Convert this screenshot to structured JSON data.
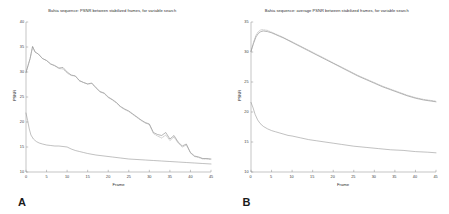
{
  "figure": {
    "panels": [
      {
        "panel_letter": "A",
        "title": "Bahia sequence: PSNR between stabilized frames, for variable search",
        "xlabel": "Frame",
        "ylabel": "PSNR"
      },
      {
        "panel_letter": "B",
        "title": "Bahia sequence: average PSNR between stabilized frames, for variable search",
        "xlabel": "Frame",
        "ylabel": "PSNR"
      }
    ]
  },
  "chart_data": [
    {
      "type": "line",
      "title": "Bahia sequence: PSNR between stabilized frames, for variable search",
      "xlabel": "Frame",
      "ylabel": "PSNR",
      "xlim": [
        0,
        45
      ],
      "ylim": [
        10,
        40
      ],
      "xticks": [
        0,
        5,
        10,
        15,
        20,
        25,
        30,
        35,
        40,
        45
      ],
      "yticks": [
        10,
        15,
        20,
        25,
        30,
        35,
        40
      ],
      "grid": false,
      "legend": "none",
      "series": [
        {
          "name": "stabilized-psnr-solid",
          "style": "solid",
          "x": [
            0,
            1,
            1.6,
            2.2,
            3,
            4,
            5,
            6,
            7,
            8,
            9,
            10,
            11,
            12,
            13,
            14,
            15,
            16,
            17,
            18,
            19,
            20,
            21,
            22,
            23,
            24,
            25,
            26,
            27,
            28,
            29,
            30,
            31,
            32,
            33,
            34,
            35,
            36,
            37,
            38,
            39,
            40,
            41,
            42,
            43,
            44,
            45
          ],
          "y": [
            29.9,
            32.7,
            35.1,
            34.0,
            33.6,
            32.7,
            32.3,
            31.6,
            31.3,
            30.8,
            30.9,
            30.0,
            29.4,
            29.2,
            28.3,
            27.9,
            27.6,
            27.8,
            26.9,
            26.1,
            25.8,
            25.0,
            24.5,
            23.9,
            23.1,
            22.6,
            22.2,
            21.6,
            21.0,
            20.4,
            19.9,
            19.6,
            17.9,
            17.5,
            17.3,
            17.9,
            16.6,
            17.3,
            16.0,
            15.2,
            15.6,
            13.9,
            13.2,
            13.0,
            12.7,
            12.7,
            12.6
          ]
        },
        {
          "name": "stabilized-psnr-dashed",
          "style": "dashed",
          "x": [
            0,
            1,
            1.6,
            2.2,
            3,
            4,
            5,
            6,
            7,
            8,
            9,
            10,
            11,
            12,
            13,
            14,
            15,
            16,
            17,
            18,
            19,
            20,
            21,
            22,
            23,
            24,
            25,
            26,
            27,
            28,
            29,
            30,
            31,
            32,
            33,
            34,
            35,
            36,
            37,
            38,
            39,
            40,
            41,
            42,
            43,
            44,
            45
          ],
          "y": [
            29.9,
            32.7,
            35.1,
            34.0,
            33.6,
            32.7,
            32.3,
            31.6,
            31.2,
            30.7,
            30.6,
            29.8,
            29.3,
            29.2,
            28.2,
            27.9,
            27.6,
            27.7,
            26.8,
            26.0,
            25.7,
            24.9,
            24.4,
            23.8,
            23.0,
            22.5,
            22.1,
            21.5,
            20.9,
            20.3,
            19.8,
            19.5,
            17.7,
            17.2,
            16.8,
            17.4,
            16.3,
            17.0,
            15.8,
            15.0,
            15.4,
            13.8,
            13.1,
            12.9,
            12.6,
            12.6,
            12.5
          ]
        },
        {
          "name": "unstabilized-psnr",
          "style": "solid",
          "x": [
            0,
            0.4,
            0.8,
            1.2,
            1.8,
            2.5,
            3.2,
            4,
            5,
            6,
            7,
            8,
            9,
            10,
            11,
            12,
            13,
            14,
            15,
            17,
            19,
            21,
            23,
            25,
            27,
            29,
            31,
            33,
            35,
            37,
            39,
            41,
            43,
            45
          ],
          "y": [
            21.8,
            20.3,
            18.6,
            17.4,
            16.6,
            16.1,
            15.8,
            15.6,
            15.4,
            15.3,
            15.2,
            15.2,
            15.1,
            15.0,
            14.6,
            14.3,
            14.1,
            13.9,
            13.7,
            13.4,
            13.2,
            13.0,
            12.8,
            12.6,
            12.5,
            12.4,
            12.3,
            12.2,
            12.1,
            12.0,
            11.9,
            11.8,
            11.7,
            11.6
          ]
        }
      ]
    },
    {
      "type": "line",
      "title": "Bahia sequence: average PSNR between stabilized frames, for variable search",
      "xlabel": "Frame",
      "ylabel": "PSNR",
      "xlim": [
        0,
        45
      ],
      "ylim": [
        10,
        35
      ],
      "xticks": [
        0,
        5,
        10,
        15,
        20,
        25,
        30,
        35,
        40,
        45
      ],
      "yticks": [
        10,
        15,
        20,
        25,
        30,
        35
      ],
      "grid": false,
      "legend": "none",
      "series": [
        {
          "name": "average-stabilized-psnr-solid",
          "style": "solid",
          "x": [
            0,
            0.6,
            1.2,
            1.8,
            2.4,
            3,
            4,
            5,
            6,
            7,
            8,
            10,
            12,
            14,
            16,
            18,
            20,
            22,
            24,
            26,
            28,
            30,
            32,
            34,
            36,
            38,
            40,
            42,
            44,
            45
          ],
          "y": [
            30.1,
            31.4,
            32.5,
            33.1,
            33.4,
            33.5,
            33.4,
            33.2,
            32.9,
            32.6,
            32.3,
            31.6,
            30.9,
            30.2,
            29.5,
            28.8,
            28.1,
            27.4,
            26.7,
            26.0,
            25.4,
            24.8,
            24.2,
            23.7,
            23.2,
            22.7,
            22.3,
            22.0,
            21.8,
            21.7
          ]
        },
        {
          "name": "average-stabilized-psnr-dashed",
          "style": "dashed",
          "x": [
            0,
            0.6,
            1.2,
            1.8,
            2.4,
            3,
            4,
            5,
            6,
            7,
            8,
            10,
            12,
            14,
            16,
            18,
            20,
            22,
            24,
            26,
            28,
            30,
            32,
            34,
            36,
            38,
            40,
            42,
            44,
            45
          ],
          "y": [
            30.1,
            31.6,
            32.8,
            33.4,
            33.7,
            33.7,
            33.6,
            33.3,
            33.0,
            32.7,
            32.4,
            31.7,
            31.0,
            30.3,
            29.6,
            28.9,
            28.2,
            27.5,
            26.8,
            26.1,
            25.5,
            24.9,
            24.3,
            23.8,
            23.3,
            22.8,
            22.4,
            22.1,
            21.9,
            21.8
          ]
        },
        {
          "name": "average-unstabilized-psnr",
          "style": "solid",
          "x": [
            0,
            0.5,
            1,
            1.6,
            2.2,
            3,
            4,
            5,
            6,
            7,
            8,
            9,
            10,
            12,
            14,
            16,
            18,
            20,
            22,
            25,
            28,
            31,
            34,
            37,
            40,
            43,
            45
          ],
          "y": [
            21.6,
            20.7,
            19.6,
            18.7,
            18.1,
            17.6,
            17.2,
            16.9,
            16.7,
            16.5,
            16.3,
            16.1,
            16.0,
            15.7,
            15.4,
            15.2,
            15.0,
            14.8,
            14.6,
            14.3,
            14.1,
            13.9,
            13.7,
            13.6,
            13.4,
            13.3,
            13.2
          ]
        }
      ]
    }
  ]
}
